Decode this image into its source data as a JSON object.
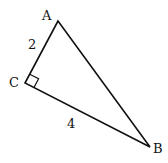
{
  "diagram": {
    "type": "right-triangle",
    "vertices": {
      "A": {
        "label": "A",
        "x": 58,
        "y": 21
      },
      "B": {
        "label": "B",
        "x": 150,
        "y": 147
      },
      "C": {
        "label": "C",
        "x": 25,
        "y": 83
      }
    },
    "right_angle_at": "C",
    "sides": {
      "AC": {
        "label": "2"
      },
      "CB": {
        "label": "4"
      }
    },
    "colors": {
      "stroke": "#111111",
      "background": "#ffffff"
    }
  }
}
